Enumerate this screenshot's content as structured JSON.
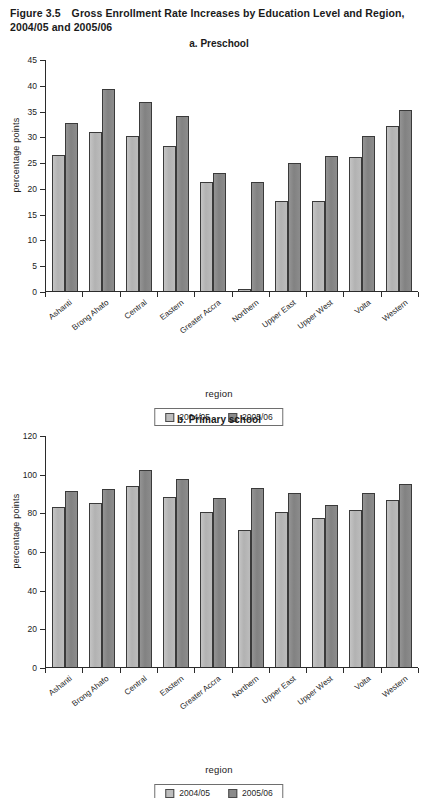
{
  "figure": {
    "number": "Figure 3.5",
    "title": "Gross Enrollment Rate Increases by Education Level and Region, 2004/05 and 2005/06"
  },
  "legend": {
    "series1_label": "2004/05",
    "series2_label": "2005/06",
    "series1_color": "#bdbdbd",
    "series2_color": "#8a8a8a"
  },
  "chart_data": [
    {
      "type": "bar",
      "panel": "a",
      "title": "a. Preschool",
      "xlabel": "region",
      "ylabel": "percentage points",
      "ylim": [
        0,
        45
      ],
      "yticks": [
        0,
        5,
        10,
        15,
        20,
        25,
        30,
        35,
        40,
        45
      ],
      "grid": false,
      "legend_position": "bottom",
      "categories": [
        "Ashanti",
        "Brong Ahafo",
        "Central",
        "Eastern",
        "Greater Accra",
        "Northern",
        "Upper East",
        "Upper West",
        "Volta",
        "Western"
      ],
      "series": [
        {
          "name": "2004/05",
          "values": [
            26.3,
            30.9,
            30.1,
            28.2,
            21.1,
            0.3,
            17.5,
            17.4,
            26.0,
            32.0
          ]
        },
        {
          "name": "2005/06",
          "values": [
            32.5,
            39.1,
            36.6,
            33.9,
            22.8,
            21.2,
            24.8,
            26.1,
            30.0,
            35.2
          ]
        }
      ]
    },
    {
      "type": "bar",
      "panel": "b",
      "title": "b. Primary school",
      "xlabel": "region",
      "ylabel": "percentage points",
      "ylim": [
        0,
        120
      ],
      "yticks": [
        0,
        20,
        40,
        60,
        80,
        100,
        120
      ],
      "grid": false,
      "legend_position": "bottom",
      "categories": [
        "Ashanti",
        "Brong Ahafo",
        "Central",
        "Eastern",
        "Greater Accra",
        "Northern",
        "Upper East",
        "Upper West",
        "Volta",
        "Western"
      ],
      "series": [
        {
          "name": "2004/05",
          "values": [
            83.0,
            85.0,
            93.5,
            88.0,
            80.0,
            71.0,
            80.2,
            77.0,
            81.2,
            86.5
          ]
        },
        {
          "name": "2005/06",
          "values": [
            91.0,
            92.2,
            102.0,
            97.0,
            87.2,
            92.5,
            90.0,
            84.0,
            89.8,
            94.5
          ]
        }
      ]
    }
  ]
}
